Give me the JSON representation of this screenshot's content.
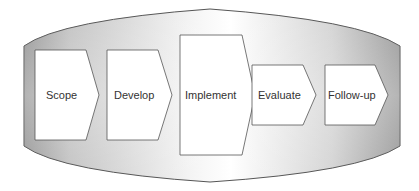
{
  "diagram": {
    "type": "process-flow",
    "container": {
      "shape": "lens",
      "gradient_colors": [
        "#9a9a9a",
        "#f4f4f4",
        "#ffffff",
        "#f0f0f0",
        "#9c9c9c"
      ],
      "border_color": "#555555"
    },
    "steps": [
      {
        "label": "Scope"
      },
      {
        "label": "Develop"
      },
      {
        "label": "Implement"
      },
      {
        "label": "Evaluate"
      },
      {
        "label": "Follow-up"
      }
    ],
    "step_fill": "#ffffff",
    "step_stroke": "#555555",
    "text_color": "#333333"
  }
}
